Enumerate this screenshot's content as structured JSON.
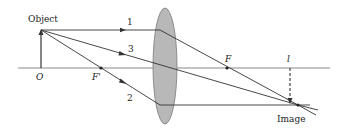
{
  "diagram": {
    "type": "thin-lens ray diagram (converging lens)",
    "labels": {
      "object": "Object",
      "origin": "O",
      "focal_point_front": "F'",
      "focal_point_back": "F",
      "image_distance": "l",
      "image": "Image",
      "ray1": "1",
      "ray2": "2",
      "ray3": "3"
    },
    "colors": {
      "lens_fill": "#b8b8b8",
      "lens_stroke": "#7a7a7a",
      "axis": "#8a8a8a",
      "ray": "#333333"
    },
    "rays": [
      {
        "id": "1",
        "description": "parallel to axis, refracts through F"
      },
      {
        "id": "2",
        "description": "through F', emerges parallel to axis"
      },
      {
        "id": "3",
        "description": "through lens center, undeviated"
      }
    ]
  }
}
